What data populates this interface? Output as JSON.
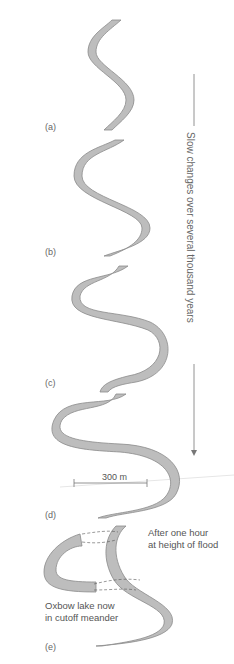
{
  "figure": {
    "panels": [
      {
        "id": "a",
        "label": "(a)"
      },
      {
        "id": "b",
        "label": "(b)"
      },
      {
        "id": "c",
        "label": "(c)"
      },
      {
        "id": "d",
        "label": "(d)"
      },
      {
        "id": "e",
        "label": "(e)"
      }
    ],
    "time_axis_label": "Slow changes over several thousand years",
    "scale_bar_label": "300 m",
    "annotation_flood": [
      "After one hour",
      "at height of flood"
    ],
    "annotation_oxbow": [
      "Oxbow lake now",
      "in cutoff meander"
    ],
    "colors": {
      "river_fill": "#bdbdbd",
      "river_edge": "#8a8a8a",
      "lines": "#777777"
    }
  }
}
